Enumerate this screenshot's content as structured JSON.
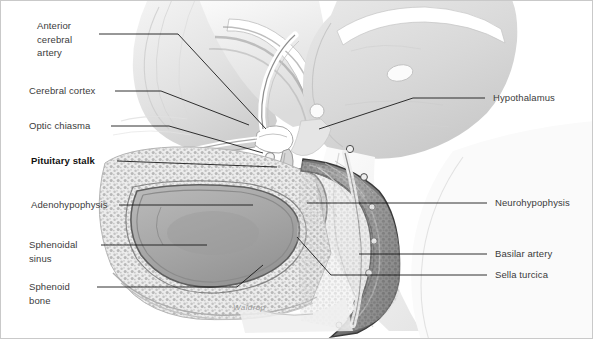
{
  "figure": {
    "signature": "Waldrop",
    "background_color": "#ffffff",
    "border_color": "#c9c9c9",
    "label_color": "#3b3b3b",
    "leader_color": "#1a1a1a"
  },
  "labels_left": [
    {
      "name": "anterior-cerebral-artery",
      "lines": [
        "Anterior",
        "cerebral",
        "artery"
      ],
      "text": "Anterior\ncerebral\nartery",
      "emphasis": "normal"
    },
    {
      "name": "cerebral-cortex",
      "lines": [
        "Cerebral cortex"
      ],
      "text": "Cerebral cortex",
      "emphasis": "normal"
    },
    {
      "name": "optic-chiasma",
      "lines": [
        "Optic chiasma"
      ],
      "text": "Optic chiasma",
      "emphasis": "normal"
    },
    {
      "name": "pituitary-stalk",
      "lines": [
        "Pituitary stalk"
      ],
      "text": "Pituitary stalk",
      "emphasis": "bold"
    },
    {
      "name": "adenohypophysis",
      "lines": [
        "Adenohypophysis"
      ],
      "text": "Adenohypophysis",
      "emphasis": "normal"
    },
    {
      "name": "sphenoidal-sinus",
      "lines": [
        "Sphenoidal",
        "sinus"
      ],
      "text": "Sphenoidal\nsinus",
      "emphasis": "normal"
    },
    {
      "name": "sphenoid-bone",
      "lines": [
        "Sphenoid",
        "bone"
      ],
      "text": "Sphenoid\nbone",
      "emphasis": "normal"
    }
  ],
  "labels_right": [
    {
      "name": "hypothalamus",
      "lines": [
        "Hypothalamus"
      ],
      "text": "Hypothalamus",
      "emphasis": "normal"
    },
    {
      "name": "neurohypophysis",
      "lines": [
        "Neurohypophysis"
      ],
      "text": "Neurohypophysis",
      "emphasis": "normal"
    },
    {
      "name": "basilar-artery",
      "lines": [
        "Basilar artery"
      ],
      "text": "Basilar artery",
      "emphasis": "normal"
    },
    {
      "name": "sella-turcica",
      "lines": [
        "Sella turcica"
      ],
      "text": "Sella turcica",
      "emphasis": "normal"
    }
  ]
}
